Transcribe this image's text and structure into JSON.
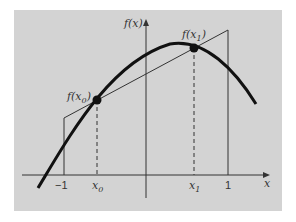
{
  "diagram": {
    "background_color": "#d3d3d3",
    "labels": {
      "y_axis": "f(x)",
      "x_axis": "x",
      "point0": "f(x",
      "point0_sub": "0",
      "point1": "f(x",
      "point1_sub": "1",
      "close_paren": ")",
      "tick_minus1": "−1",
      "tick_x0": "x",
      "tick_x0_sub": "0",
      "tick_x1": "x",
      "tick_x1_sub": "1",
      "tick_1": "1"
    }
  }
}
